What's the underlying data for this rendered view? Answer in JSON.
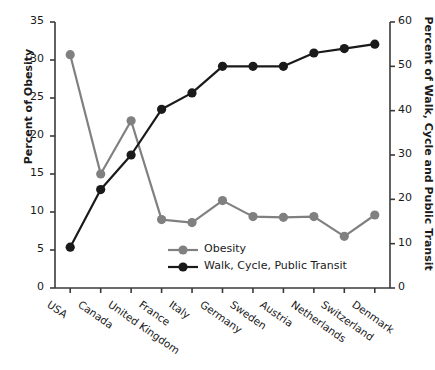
{
  "chart_data": {
    "type": "line",
    "title": "",
    "xlabel": "",
    "categories": [
      "USA",
      "Canada",
      "United Kingdom",
      "France",
      "Italy",
      "Germany",
      "Sweden",
      "Austria",
      "Netherlands",
      "Switzerland",
      "Denmark"
    ],
    "grid": false,
    "legend_position": "inside-bottom-center",
    "axes": {
      "left": {
        "label": "Percent of Obesity",
        "min": 0,
        "max": 35,
        "step": 5,
        "ticks": [
          "0",
          "5",
          "10",
          "15",
          "20",
          "25",
          "30",
          "35"
        ]
      },
      "right": {
        "label": "Percent of Walk, Cycle and Public Transit",
        "min": 0,
        "max": 60,
        "step": 10,
        "ticks": [
          "0",
          "10",
          "20",
          "30",
          "40",
          "50",
          "60"
        ]
      }
    },
    "series": [
      {
        "name": "Obesity",
        "axis": "left",
        "color": "#808080",
        "marker": "circle",
        "values": [
          30.7,
          15.0,
          22.0,
          9.0,
          8.6,
          11.5,
          9.4,
          9.3,
          9.4,
          6.8,
          9.6
        ]
      },
      {
        "name": "Walk, Cycle, Public Transit",
        "axis": "right",
        "color": "#1a1a1a",
        "marker": "circle",
        "values": [
          9.2,
          22.2,
          30.0,
          40.3,
          44.0,
          50.0,
          50.0,
          50.0,
          53.0,
          54.0,
          55.0
        ]
      }
    ],
    "legend": [
      {
        "label": "Obesity",
        "color": "#808080"
      },
      {
        "label": "Walk, Cycle, Public Transit",
        "color": "#1a1a1a"
      }
    ]
  }
}
